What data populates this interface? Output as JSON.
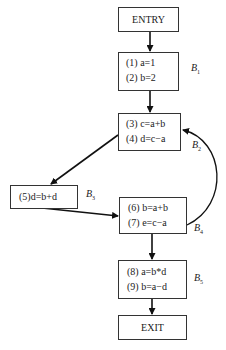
{
  "diagram": {
    "type": "control-flow-graph",
    "nodes": {
      "entry": {
        "label": "ENTRY"
      },
      "b1": {
        "name": "B",
        "sub": "1",
        "statements": [
          "(1) a=1",
          "(2) b=2"
        ]
      },
      "b2": {
        "name": "B",
        "sub": "2",
        "statements": [
          "(3) c=a+b",
          "(4) d=c−a"
        ]
      },
      "b3": {
        "name": "B",
        "sub": "3",
        "statements": [
          "(5)d=b+d"
        ]
      },
      "b4": {
        "name": "B",
        "sub": "4",
        "statements": [
          "(6) b=a+b",
          "(7) e=c−a"
        ]
      },
      "b5": {
        "name": "B",
        "sub": "5",
        "statements": [
          "(8) a=b*d",
          "(9) b=a−d"
        ]
      },
      "exit": {
        "label": "EXIT"
      }
    },
    "edges": [
      {
        "from": "ENTRY",
        "to": "B1"
      },
      {
        "from": "B1",
        "to": "B2"
      },
      {
        "from": "B2",
        "to": "B3"
      },
      {
        "from": "B3",
        "to": "B4"
      },
      {
        "from": "B4",
        "to": "B2"
      },
      {
        "from": "B4",
        "to": "B5"
      },
      {
        "from": "B5",
        "to": "EXIT"
      }
    ]
  }
}
